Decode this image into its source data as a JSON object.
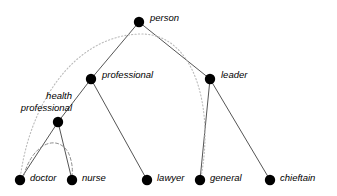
{
  "figure": {
    "type": "hierarchy-tree-diagram",
    "background_color": "#ffffff",
    "edge_color": "#555555",
    "node_color": "#000000",
    "dotted_color": "#bbbbbb",
    "dashed_color": "#888888",
    "node_radius": 5
  },
  "nodes": [
    {
      "id": "person",
      "label": "person",
      "x": 139,
      "y": 22,
      "label_x": 150,
      "label_y": 12,
      "lines": [
        "person"
      ]
    },
    {
      "id": "professional",
      "label": "professional",
      "x": 91,
      "y": 79,
      "label_x": 102,
      "label_y": 69,
      "lines": [
        "professional"
      ]
    },
    {
      "id": "leader",
      "label": "leader",
      "x": 210,
      "y": 79,
      "label_x": 221,
      "label_y": 69,
      "lines": [
        "leader"
      ]
    },
    {
      "id": "health_professional",
      "label": "health professional",
      "x": 58,
      "y": 122,
      "label_x": 0,
      "label_y": 90,
      "lines": [
        "health",
        "professional"
      ]
    },
    {
      "id": "doctor",
      "label": "doctor",
      "x": 20,
      "y": 180,
      "label_x": 30,
      "label_y": 172,
      "lines": [
        "doctor"
      ]
    },
    {
      "id": "nurse",
      "label": "nurse",
      "x": 72,
      "y": 180,
      "label_x": 82,
      "label_y": 172,
      "lines": [
        "nurse"
      ]
    },
    {
      "id": "lawyer",
      "label": "lawyer",
      "x": 147,
      "y": 180,
      "label_x": 157,
      "label_y": 172,
      "lines": [
        "lawyer"
      ]
    },
    {
      "id": "general",
      "label": "general",
      "x": 200,
      "y": 180,
      "label_x": 210,
      "label_y": 172,
      "lines": [
        "general"
      ]
    },
    {
      "id": "chieftain",
      "label": "chieftain",
      "x": 270,
      "y": 180,
      "label_x": 280,
      "label_y": 172,
      "lines": [
        "chieftain"
      ]
    }
  ],
  "edges": [
    {
      "from": "person",
      "to": "professional",
      "style": "solid"
    },
    {
      "from": "person",
      "to": "leader",
      "style": "solid"
    },
    {
      "from": "professional",
      "to": "health_professional",
      "style": "solid"
    },
    {
      "from": "professional",
      "to": "lawyer",
      "style": "solid"
    },
    {
      "from": "health_professional",
      "to": "doctor",
      "style": "solid"
    },
    {
      "from": "health_professional",
      "to": "nurse",
      "style": "solid"
    },
    {
      "from": "leader",
      "to": "general",
      "style": "solid"
    },
    {
      "from": "leader",
      "to": "chieftain",
      "style": "solid"
    }
  ],
  "curves": [
    {
      "id": "doctor-to-general-arc",
      "style": "dotted",
      "from": "doctor",
      "to": "general",
      "path": "M 20 180 C 28 110, 70 36, 140 34 C 196 33, 214 110, 201 177"
    },
    {
      "id": "doctor-to-nurse-arc",
      "style": "dashed",
      "from": "doctor",
      "to": "nurse",
      "path": "M 24 175 C 32 145, 56 133, 68 152 C 72 160, 73 170, 72 175"
    }
  ]
}
